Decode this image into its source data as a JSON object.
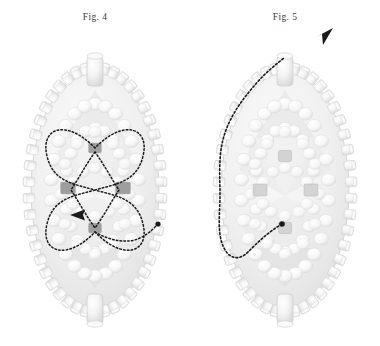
{
  "page": {
    "background_color": "#ffffff",
    "width": 380,
    "height": 346,
    "style": "grayscale scientific patent figure, two prolate icosahedral virus capsid diagrams with dotted translocation paths"
  },
  "figures": [
    {
      "id": "fig4",
      "caption": "Fig. 4",
      "panel_side": "left",
      "capsid": {
        "shape": "prolate icosahedral capsid (elongated ovoid)",
        "center_x": 95,
        "center_y": 190,
        "radius_x": 68,
        "radius_y": 126,
        "shell_color": "#e8e8e8",
        "shell_edge_color": "#cfcfcf",
        "interior_color": "#f2f2f2",
        "capsomere_count": 46,
        "capsomere_shape": "cylinder",
        "capsomere_color": "#e2e2e2",
        "has_top_portal": true,
        "has_bottom_portal": true,
        "portal_color": "#e6e6e6"
      },
      "markers": {
        "color": "#9a9a9a",
        "shape": "square",
        "items": [
          {
            "name": "marker-top",
            "x": 95,
            "y": 148,
            "w": 13,
            "h": 10
          },
          {
            "name": "marker-left",
            "x": 68,
            "y": 188,
            "w": 15,
            "h": 12
          },
          {
            "name": "marker-right",
            "x": 123,
            "y": 188,
            "w": 15,
            "h": 12
          },
          {
            "name": "marker-bottom",
            "x": 95,
            "y": 228,
            "w": 13,
            "h": 10
          }
        ]
      },
      "path": {
        "label": "butterfly / bowtie shaped dotted translocation path",
        "stroke_color": "#1a1a1a",
        "stroke_width": 1.5,
        "dash_pattern": "1.6 2.2",
        "arrow": {
          "present": true,
          "direction": "left",
          "x": 80,
          "y": 215
        },
        "endpoint_dot": {
          "present": true,
          "x": 158,
          "y": 224,
          "r": 2.6
        },
        "d_outer": "M95,148 C66,118 40,128 47,156 C53,182 74,184 95,190 C116,184 137,182 143,156 C150,128 124,118 95,148 Z M95,190 C74,196 53,198 47,224 C40,252 66,262 95,232 C124,262 150,252 143,224 C137,198 116,196 95,190 Z",
        "d_inner": "M95,152 C85,166 79,178 71,190 C79,202 85,214 95,228 C105,214 111,202 119,190 C111,178 105,166 95,152 Z",
        "d_tail": "M95,232 C110,241 128,244 140,238 C150,233 154,228 158,224"
      }
    },
    {
      "id": "fig5",
      "caption": "Fig. 5",
      "panel_side": "right",
      "capsid": {
        "shape": "prolate icosahedral capsid (elongated ovoid)",
        "center_x": 95,
        "center_y": 190,
        "radius_x": 68,
        "radius_y": 126,
        "shell_color": "#e8e8e8",
        "shell_edge_color": "#cfcfcf",
        "interior_color": "#f2f2f2",
        "capsomere_count": 46,
        "capsomere_shape": "cylinder",
        "capsomere_color": "#e2e2e2",
        "has_top_portal": true,
        "has_bottom_portal": true,
        "portal_color": "#e6e6e6"
      },
      "markers": {
        "color": "#d2d2d2",
        "shape": "square",
        "items": [
          {
            "name": "marker-top",
            "x": 95,
            "y": 156,
            "w": 13,
            "h": 11
          },
          {
            "name": "marker-left",
            "x": 70,
            "y": 190,
            "w": 14,
            "h": 12
          },
          {
            "name": "marker-right",
            "x": 121,
            "y": 190,
            "w": 14,
            "h": 12
          },
          {
            "name": "marker-bottom",
            "x": 95,
            "y": 228,
            "w": 13,
            "h": 11
          }
        ]
      },
      "path": {
        "label": "escape / exit dotted translocation path running up the left flank and out the top portal",
        "stroke_color": "#1a1a1a",
        "stroke_width": 1.6,
        "dash_pattern": "1.8 2.2",
        "arrow": {
          "present": true,
          "direction": "up-right",
          "x": 131,
          "y": 38
        },
        "endpoint_dot": {
          "present": true,
          "x": 92,
          "y": 224,
          "r": 2.8
        },
        "d_main": "M92,224 C78,232 66,244 58,252 C48,262 38,258 33,246 C27,232 30,212 30,196 C30,176 28,156 34,136 C40,116 52,100 64,86 C74,74 84,66 94,58"
      }
    }
  ]
}
